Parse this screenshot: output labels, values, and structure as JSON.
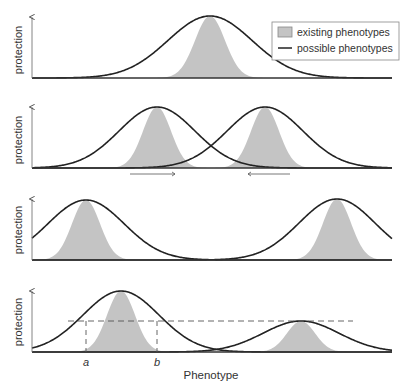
{
  "figure": {
    "y_axis_label": "protection",
    "x_axis_label": "Phenotype",
    "legend": {
      "existing": "existing phenotypes",
      "possible": "possible phenotypes"
    },
    "marker_a": "a",
    "marker_b": "b"
  },
  "colors": {
    "curve": "#222222",
    "fill": "#c4c4c4",
    "axis": "#333333",
    "dashed": "#555555",
    "arrow": "#555555"
  },
  "panels": [
    {
      "id": 1,
      "baseline": 78,
      "top": 17,
      "possible": [
        {
          "mu": 210,
          "sigma": 42,
          "peak": 16
        }
      ],
      "existing": [
        {
          "mu": 210,
          "sigma": 15,
          "peak": 16
        }
      ]
    },
    {
      "id": 2,
      "baseline": 168,
      "top": 107,
      "possible": [
        {
          "mu": 157,
          "sigma": 38,
          "peak": 107
        },
        {
          "mu": 265,
          "sigma": 38,
          "peak": 107
        }
      ],
      "existing": [
        {
          "mu": 157,
          "sigma": 14,
          "peak": 107
        },
        {
          "mu": 265,
          "sigma": 14,
          "peak": 107
        }
      ],
      "arrows": [
        {
          "from": 130,
          "to": 175,
          "dir": "right"
        },
        {
          "from": 290,
          "to": 248,
          "dir": "left"
        }
      ]
    },
    {
      "id": 3,
      "baseline": 260,
      "top": 199,
      "possible": [
        {
          "mu": 86,
          "sigma": 38,
          "peak": 200
        },
        {
          "mu": 337,
          "sigma": 38,
          "peak": 199
        }
      ],
      "existing": [
        {
          "mu": 86,
          "sigma": 14,
          "peak": 200
        },
        {
          "mu": 337,
          "sigma": 14,
          "peak": 199
        }
      ]
    },
    {
      "id": 4,
      "baseline": 352,
      "top": 291,
      "possible": [
        {
          "mu": 121,
          "sigma": 38,
          "peak": 291
        },
        {
          "mu": 301,
          "sigma": 38,
          "peak": 321
        }
      ],
      "existing": [
        {
          "mu": 121,
          "sigma": 14,
          "peak": 291
        },
        {
          "mu": 301,
          "sigma": 14,
          "peak": 321
        }
      ],
      "threshold": {
        "y": 321,
        "x1": 68,
        "x2": 353
      },
      "a_x": 86,
      "b_x": 157
    }
  ]
}
